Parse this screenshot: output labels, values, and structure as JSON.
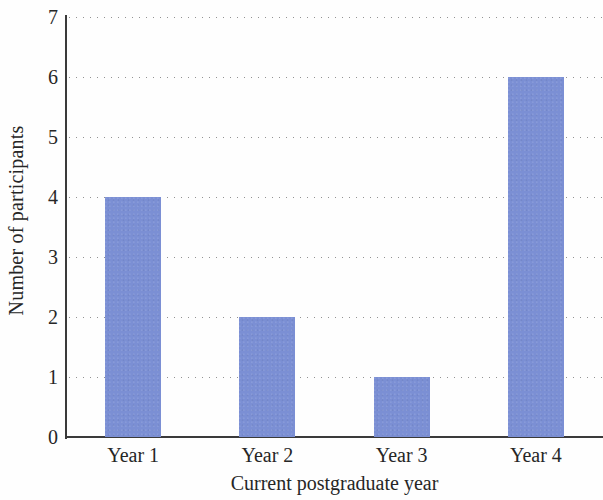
{
  "chart_data": {
    "type": "bar",
    "title": "",
    "categories": [
      "Year 1",
      "Year 2",
      "Year 3",
      "Year 4"
    ],
    "values": [
      4,
      2,
      1,
      6
    ],
    "series": [
      {
        "name": "Number of participants",
        "values": [
          4,
          2,
          1,
          6
        ]
      }
    ],
    "xlabel": "Current postgraduate year",
    "ylabel": "Number of participants",
    "ylim": [
      0,
      7
    ],
    "ytick_labels": [
      "0",
      "1",
      "2",
      "3",
      "4",
      "5",
      "6",
      "7"
    ],
    "ytick_values": [
      0,
      1,
      2,
      3,
      4,
      5,
      6,
      7
    ],
    "ytick_step": 1,
    "grid": "horizontal-dotted",
    "legend": "none",
    "bar_color": "#7b8fd4",
    "axis_color": "#3a3a3a",
    "gridline_color": "#8d8d8d"
  }
}
